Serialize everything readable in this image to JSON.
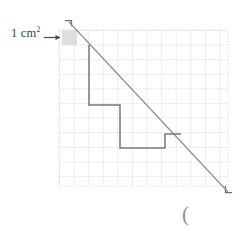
{
  "figure": {
    "unit_label_text": "1 cm",
    "unit_label_exponent": "2",
    "arrow_icon": "right-arrow-icon",
    "paren_text": "(",
    "corner_mark_top_left": "corner-bracket-top-left",
    "corner_mark_bottom_right": "corner-bracket-bottom-right",
    "colors": {
      "grid_line": "#d9d9e2",
      "grid_dot": "#c9c9d4",
      "diagonal_line": "#8a8a8a",
      "staircase_line": "#7a7a7a",
      "shaded_cell": "#dcdcdc",
      "text": "#3f3f3f",
      "corner_mark": "#6e6e6e"
    }
  },
  "chart_data": {
    "type": "line",
    "title": "",
    "subtitle": "",
    "xlabel": "",
    "ylabel": "",
    "grid": true,
    "legend_position": "none",
    "annotations": [
      {
        "text": "1 cm²",
        "target": "shaded unit square at grid cell (0,0)",
        "arrow": "right"
      },
      {
        "text": "(",
        "target": "below figure, bottom right"
      }
    ],
    "grid_geometry": {
      "cell_size_px": 14.6,
      "x_left_px": 59,
      "x_right_px": 228,
      "y_top_px": 30,
      "y_bottom_px": 186,
      "columns": 11.5,
      "rows": 10.5
    },
    "shaded_unit_square": {
      "x": 62,
      "y": 30,
      "width": 15,
      "height": 15,
      "area_label": "1 cm²"
    },
    "series": [
      {
        "name": "diagonal-reference-line",
        "type": "line",
        "points": [
          [
            69,
            22
          ],
          [
            228,
            192
          ]
        ]
      },
      {
        "name": "staircase-outline",
        "type": "line",
        "points": [
          [
            89,
            45
          ],
          [
            89,
            105
          ],
          [
            120,
            105
          ],
          [
            120,
            148
          ],
          [
            165,
            148
          ],
          [
            165,
            134
          ],
          [
            181,
            134
          ]
        ]
      }
    ],
    "corner_marks": [
      {
        "name": "top-left",
        "x": 69,
        "y": 21
      },
      {
        "name": "bottom-right",
        "x": 228,
        "y": 191
      }
    ]
  }
}
